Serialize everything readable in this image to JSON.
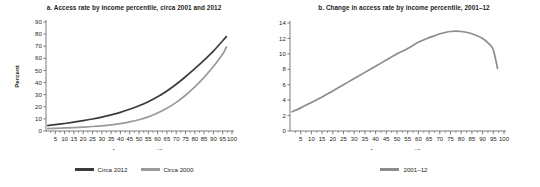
{
  "figure": {
    "panels": [
      {
        "id": "a",
        "title": "a. Access rate by income percentile, circa 2001 and 2012",
        "legend": [
          {
            "label": "Circa 2012",
            "color": "#3b3b3b"
          },
          {
            "label": "Circa 2000",
            "color": "#9a9a9a"
          }
        ]
      },
      {
        "id": "b",
        "title": "b. Change in access rate by income percentile, 2001–12",
        "legend": [
          {
            "label": "2001–12",
            "color": "#8c8c8c"
          }
        ]
      }
    ]
  },
  "chart_data": [
    {
      "type": "line",
      "panel": "a",
      "title": "a. Access rate by income percentile, circa 2001 and 2012",
      "xlabel": "Income percentile",
      "ylabel": "Percent",
      "xlim": [
        0,
        100
      ],
      "ylim": [
        0,
        90
      ],
      "xticks": [
        5,
        10,
        15,
        20,
        25,
        30,
        35,
        40,
        45,
        50,
        55,
        60,
        65,
        70,
        75,
        80,
        85,
        90,
        95,
        100
      ],
      "yticks": [
        0,
        10,
        20,
        30,
        40,
        50,
        60,
        70,
        80,
        90
      ],
      "grid": false,
      "legend_position": "bottom",
      "x": [
        1,
        5,
        10,
        15,
        20,
        25,
        30,
        35,
        40,
        45,
        50,
        55,
        60,
        65,
        70,
        75,
        80,
        85,
        90,
        95,
        97
      ],
      "series": [
        {
          "name": "Circa 2012",
          "color": "#3b3b3b",
          "values": [
            4.5,
            5.2,
            6.2,
            7.3,
            8.5,
            9.9,
            11.5,
            13.3,
            15.4,
            17.9,
            20.8,
            24.2,
            28.2,
            33.0,
            38.6,
            44.8,
            51.5,
            58.5,
            66.0,
            74.5,
            78.0
          ]
        },
        {
          "name": "Circa 2000",
          "color": "#9a9a9a",
          "values": [
            2.0,
            2.2,
            2.5,
            2.8,
            3.2,
            3.7,
            4.3,
            5.1,
            6.1,
            7.5,
            9.3,
            11.7,
            14.8,
            18.7,
            23.6,
            29.5,
            36.4,
            44.3,
            53.2,
            63.5,
            69.5
          ]
        }
      ]
    },
    {
      "type": "line",
      "panel": "b",
      "title": "b. Change in access rate by income percentile, 2001–12",
      "xlabel": "Income percentile",
      "ylabel": "Percentage points",
      "xlim": [
        0,
        100
      ],
      "ylim": [
        0,
        14
      ],
      "xticks": [
        5,
        10,
        15,
        20,
        25,
        30,
        35,
        40,
        45,
        50,
        55,
        60,
        65,
        70,
        75,
        80,
        85,
        90,
        95,
        100
      ],
      "yticks": [
        0,
        2,
        4,
        6,
        8,
        10,
        12,
        14
      ],
      "grid": false,
      "legend_position": "bottom",
      "x": [
        1,
        5,
        10,
        15,
        20,
        25,
        30,
        35,
        40,
        45,
        50,
        55,
        60,
        65,
        67,
        70,
        75,
        80,
        85,
        90,
        93,
        95,
        97
      ],
      "series": [
        {
          "name": "2001–12",
          "color": "#8c8c8c",
          "values": [
            2.5,
            3.0,
            3.7,
            4.4,
            5.2,
            6.0,
            6.8,
            7.6,
            8.4,
            9.2,
            10.0,
            10.7,
            11.5,
            12.1,
            12.3,
            12.6,
            12.9,
            12.9,
            12.6,
            12.0,
            11.3,
            10.5,
            8.1
          ]
        }
      ]
    }
  ]
}
